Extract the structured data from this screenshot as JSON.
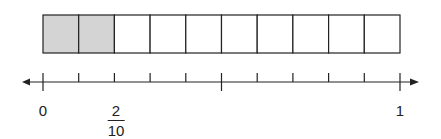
{
  "diagram": {
    "title": "",
    "bar": {
      "total_parts": 10,
      "shaded_parts": 2,
      "shade_color": "#d4d4d4",
      "border_color": "#222222"
    },
    "number_line": {
      "min": 0,
      "max": 1,
      "divisions": 10,
      "long_ticks_at": [
        0,
        5,
        10
      ],
      "arrows": "both"
    },
    "labels": {
      "zero": "0",
      "fraction_numerator": "2",
      "fraction_denominator": "10",
      "one": "1"
    }
  },
  "chart_data": {
    "type": "table",
    "bar_parts": 10,
    "shaded": 2,
    "number_line_ticks": [
      "0",
      "1/10",
      "2/10",
      "3/10",
      "4/10",
      "5/10",
      "6/10",
      "7/10",
      "8/10",
      "9/10",
      "1"
    ],
    "labeled_points": [
      {
        "position": 0,
        "label": "0"
      },
      {
        "position": 0.2,
        "label": "2/10"
      },
      {
        "position": 1,
        "label": "1"
      }
    ]
  }
}
